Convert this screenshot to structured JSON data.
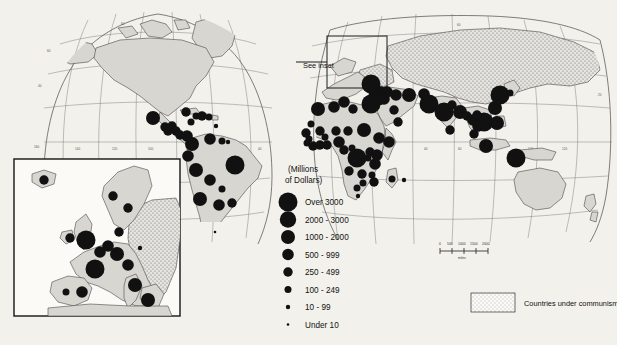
{
  "map": {
    "projection_note": "interrupted homolosine-style world map, two northern lobes",
    "inset_pointer_label": "See inset",
    "background_color": "#f3f1ec",
    "land_color": "#d8d6d1",
    "dot_color": "#111111",
    "communist_fill": "stipple"
  },
  "legend": {
    "units_line1": "(Millions",
    "units_line2": "of Dollars)",
    "classes": [
      {
        "label": "Over 3000",
        "radius_px": 9.5
      },
      {
        "label": "2000 - 3000",
        "radius_px": 8.2
      },
      {
        "label": "1000 - 2000",
        "radius_px": 7.0
      },
      {
        "label": "500 - 999",
        "radius_px": 5.8
      },
      {
        "label": "250 - 499",
        "radius_px": 4.7
      },
      {
        "label": "100 - 249",
        "radius_px": 3.5
      },
      {
        "label": "10 - 99",
        "radius_px": 2.2
      },
      {
        "label": "Under 10",
        "radius_px": 1.3
      }
    ]
  },
  "communism_legend": {
    "label": "Countries under communism",
    "swatch": "stipple"
  },
  "scale_bar": {
    "ticks": [
      "0",
      "500",
      "1000",
      "1500",
      "2000"
    ],
    "units": "miles"
  },
  "graticule_labels": {
    "top_lobe_left": [
      "60"
    ],
    "top_lobe_right": [
      "60"
    ],
    "left_lobe": [
      "60",
      "40"
    ],
    "equatorial": [
      "160",
      "140",
      "120",
      "100",
      "80",
      "60",
      "40",
      "20"
    ],
    "eastern": [
      "20",
      "40",
      "60",
      "80",
      "100",
      "120",
      "140",
      "160"
    ]
  },
  "chart_data": {
    "type": "map",
    "symbol": "graduated circle",
    "value_classes": [
      "Over 3000",
      "2000 - 3000",
      "1000 - 2000",
      "500 - 999",
      "250 - 499",
      "100 - 249",
      "10 - 99",
      "Under 10"
    ],
    "regions": [
      {
        "name": "Mexico",
        "class": "1000 - 2000",
        "x": 153,
        "y": 118
      },
      {
        "name": "Cuba",
        "class": "250 - 499",
        "x": 186,
        "y": 112
      },
      {
        "name": "Haiti",
        "class": "100 - 249",
        "x": 196,
        "y": 116
      },
      {
        "name": "Dom. Republic",
        "class": "250 - 499",
        "x": 202,
        "y": 116
      },
      {
        "name": "Guatemala",
        "class": "250 - 499",
        "x": 165,
        "y": 127
      },
      {
        "name": "Honduras",
        "class": "250 - 499",
        "x": 172,
        "y": 126
      },
      {
        "name": "El Salvador",
        "class": "250 - 499",
        "x": 168,
        "y": 131
      },
      {
        "name": "Nicaragua",
        "class": "250 - 499",
        "x": 176,
        "y": 131
      },
      {
        "name": "Costa Rica",
        "class": "250 - 499",
        "x": 180,
        "y": 135
      },
      {
        "name": "Panama",
        "class": "500 - 999",
        "x": 187,
        "y": 136
      },
      {
        "name": "Jamaica",
        "class": "100 - 249",
        "x": 191,
        "y": 122
      },
      {
        "name": "Puerto Rico",
        "class": "100 - 249",
        "x": 209,
        "y": 117
      },
      {
        "name": "Trinidad",
        "class": "10 - 99",
        "x": 216,
        "y": 126
      },
      {
        "name": "Colombia",
        "class": "1000 - 2000",
        "x": 192,
        "y": 144
      },
      {
        "name": "Venezuela",
        "class": "500 - 999",
        "x": 210,
        "y": 139
      },
      {
        "name": "Guyana",
        "class": "100 - 249",
        "x": 222,
        "y": 141
      },
      {
        "name": "Suriname",
        "class": "10 - 99",
        "x": 228,
        "y": 142
      },
      {
        "name": "Ecuador",
        "class": "500 - 999",
        "x": 188,
        "y": 156
      },
      {
        "name": "Peru",
        "class": "1000 - 2000",
        "x": 196,
        "y": 170
      },
      {
        "name": "Brazil",
        "class": "Over 3000",
        "x": 235,
        "y": 165
      },
      {
        "name": "Bolivia",
        "class": "500 - 999",
        "x": 210,
        "y": 180
      },
      {
        "name": "Paraguay",
        "class": "100 - 249",
        "x": 222,
        "y": 189
      },
      {
        "name": "Chile",
        "class": "1000 - 2000",
        "x": 200,
        "y": 199
      },
      {
        "name": "Argentina",
        "class": "500 - 999",
        "x": 219,
        "y": 205
      },
      {
        "name": "Uruguay",
        "class": "250 - 499",
        "x": 232,
        "y": 203
      },
      {
        "name": "Falklands",
        "class": "Under 10",
        "x": 215,
        "y": 232
      },
      {
        "name": "Morocco",
        "class": "1000 - 2000",
        "x": 318,
        "y": 109
      },
      {
        "name": "Algeria",
        "class": "500 - 999",
        "x": 334,
        "y": 107
      },
      {
        "name": "Tunisia",
        "class": "500 - 999",
        "x": 344,
        "y": 102
      },
      {
        "name": "Libya",
        "class": "250 - 499",
        "x": 353,
        "y": 109
      },
      {
        "name": "Egypt",
        "class": "Over 3000",
        "x": 371,
        "y": 104
      },
      {
        "name": "Israel",
        "class": "Over 3000",
        "x": 378,
        "y": 96
      },
      {
        "name": "Lebanon",
        "class": "250 - 499",
        "x": 381,
        "y": 91
      },
      {
        "name": "Syria",
        "class": "500 - 999",
        "x": 387,
        "y": 92
      },
      {
        "name": "Jordan",
        "class": "500 - 999",
        "x": 384,
        "y": 99
      },
      {
        "name": "Turkey",
        "class": "Over 3000",
        "x": 371,
        "y": 84
      },
      {
        "name": "Iraq",
        "class": "500 - 999",
        "x": 396,
        "y": 95
      },
      {
        "name": "Iran",
        "class": "1000 - 2000",
        "x": 409,
        "y": 95
      },
      {
        "name": "Saudi Arabia",
        "class": "250 - 499",
        "x": 394,
        "y": 110
      },
      {
        "name": "Yemen",
        "class": "250 - 499",
        "x": 398,
        "y": 122
      },
      {
        "name": "Afghanistan",
        "class": "500 - 999",
        "x": 424,
        "y": 94
      },
      {
        "name": "Pakistan",
        "class": "Over 3000",
        "x": 429,
        "y": 104
      },
      {
        "name": "India",
        "class": "Over 3000",
        "x": 444,
        "y": 112
      },
      {
        "name": "Nepal",
        "class": "250 - 499",
        "x": 452,
        "y": 105
      },
      {
        "name": "Sri Lanka",
        "class": "250 - 499",
        "x": 450,
        "y": 130
      },
      {
        "name": "Bangladesh",
        "class": "1000 - 2000",
        "x": 460,
        "y": 112
      },
      {
        "name": "Burma",
        "class": "250 - 499",
        "x": 467,
        "y": 116
      },
      {
        "name": "Thailand",
        "class": "500 - 999",
        "x": 473,
        "y": 120
      },
      {
        "name": "Vietnam",
        "class": "Over 3000",
        "x": 484,
        "y": 122
      },
      {
        "name": "Cambodia",
        "class": "500 - 999",
        "x": 478,
        "y": 126
      },
      {
        "name": "Laos",
        "class": "250 - 499",
        "x": 477,
        "y": 115
      },
      {
        "name": "Malaysia",
        "class": "250 - 499",
        "x": 474,
        "y": 134
      },
      {
        "name": "Indonesia",
        "class": "1000 - 2000",
        "x": 486,
        "y": 146
      },
      {
        "name": "Philippines",
        "class": "1000 - 2000",
        "x": 497,
        "y": 123
      },
      {
        "name": "Taiwan",
        "class": "1000 - 2000",
        "x": 495,
        "y": 108
      },
      {
        "name": "South Korea",
        "class": "Over 3000",
        "x": 500,
        "y": 95
      },
      {
        "name": "Japan",
        "class": "100 - 249",
        "x": 510,
        "y": 93
      },
      {
        "name": "Papua NG",
        "class": "Over 3000",
        "x": 516,
        "y": 158
      },
      {
        "name": "Mauritania",
        "class": "100 - 249",
        "x": 311,
        "y": 124
      },
      {
        "name": "Senegal",
        "class": "250 - 499",
        "x": 306,
        "y": 133
      },
      {
        "name": "Mali",
        "class": "250 - 499",
        "x": 320,
        "y": 131
      },
      {
        "name": "Guinea",
        "class": "100 - 249",
        "x": 309,
        "y": 139
      },
      {
        "name": "Sierra Leone",
        "class": "100 - 249",
        "x": 307,
        "y": 143
      },
      {
        "name": "Liberia",
        "class": "250 - 499",
        "x": 313,
        "y": 146
      },
      {
        "name": "Ivory Coast",
        "class": "250 - 499",
        "x": 320,
        "y": 145
      },
      {
        "name": "Ghana",
        "class": "250 - 499",
        "x": 327,
        "y": 145
      },
      {
        "name": "Burkina Faso",
        "class": "100 - 249",
        "x": 325,
        "y": 137
      },
      {
        "name": "Niger",
        "class": "250 - 499",
        "x": 336,
        "y": 131
      },
      {
        "name": "Nigeria",
        "class": "500 - 999",
        "x": 339,
        "y": 142
      },
      {
        "name": "Chad",
        "class": "250 - 499",
        "x": 348,
        "y": 131
      },
      {
        "name": "Sudan",
        "class": "1000 - 2000",
        "x": 364,
        "y": 130
      },
      {
        "name": "Ethiopia",
        "class": "500 - 999",
        "x": 379,
        "y": 138
      },
      {
        "name": "Somalia",
        "class": "500 - 999",
        "x": 389,
        "y": 142
      },
      {
        "name": "Cameroon",
        "class": "250 - 499",
        "x": 344,
        "y": 150
      },
      {
        "name": "CAR",
        "class": "100 - 249",
        "x": 352,
        "y": 148
      },
      {
        "name": "Zaire",
        "class": "Over 3000",
        "x": 357,
        "y": 158
      },
      {
        "name": "Uganda",
        "class": "250 - 499",
        "x": 370,
        "y": 152
      },
      {
        "name": "Kenya",
        "class": "500 - 999",
        "x": 377,
        "y": 155
      },
      {
        "name": "Tanzania",
        "class": "500 - 999",
        "x": 375,
        "y": 164
      },
      {
        "name": "Rwanda",
        "class": "100 - 249",
        "x": 368,
        "y": 158
      },
      {
        "name": "Angola",
        "class": "250 - 499",
        "x": 349,
        "y": 171
      },
      {
        "name": "Zambia",
        "class": "250 - 499",
        "x": 362,
        "y": 174
      },
      {
        "name": "Malawi",
        "class": "100 - 249",
        "x": 372,
        "y": 175
      },
      {
        "name": "Mozambique",
        "class": "250 - 499",
        "x": 374,
        "y": 182
      },
      {
        "name": "Zimbabwe",
        "class": "100 - 249",
        "x": 363,
        "y": 183
      },
      {
        "name": "Botswana",
        "class": "100 - 249",
        "x": 357,
        "y": 188
      },
      {
        "name": "Madagascar",
        "class": "100 - 249",
        "x": 392,
        "y": 179
      },
      {
        "name": "Mauritius",
        "class": "10 - 99",
        "x": 404,
        "y": 180
      },
      {
        "name": "South Africa",
        "class": "10 - 99",
        "x": 358,
        "y": 196
      }
    ],
    "inset": {
      "name": "Europe inset",
      "regions": [
        {
          "name": "Iceland",
          "class": "250 - 499",
          "x": 44,
          "y": 180
        },
        {
          "name": "Norway",
          "class": "250 - 499",
          "x": 113,
          "y": 196
        },
        {
          "name": "Sweden",
          "class": "250 - 499",
          "x": 128,
          "y": 208
        },
        {
          "name": "Denmark",
          "class": "250 - 499",
          "x": 119,
          "y": 232
        },
        {
          "name": "Ireland",
          "class": "250 - 499",
          "x": 70,
          "y": 238
        },
        {
          "name": "United Kingdom",
          "class": "Over 3000",
          "x": 86,
          "y": 240
        },
        {
          "name": "Netherlands",
          "class": "500 - 999",
          "x": 108,
          "y": 246
        },
        {
          "name": "Belgium",
          "class": "500 - 999",
          "x": 100,
          "y": 252
        },
        {
          "name": "West Germany",
          "class": "1000 - 2000",
          "x": 117,
          "y": 254
        },
        {
          "name": "Poland",
          "class": "10 - 99",
          "x": 140,
          "y": 248
        },
        {
          "name": "France",
          "class": "Over 3000",
          "x": 95,
          "y": 269
        },
        {
          "name": "Austria",
          "class": "500 - 999",
          "x": 128,
          "y": 265
        },
        {
          "name": "Spain",
          "class": "500 - 999",
          "x": 82,
          "y": 292
        },
        {
          "name": "Portugal",
          "class": "100 - 249",
          "x": 66,
          "y": 292
        },
        {
          "name": "Italy",
          "class": "1000 - 2000",
          "x": 135,
          "y": 285
        },
        {
          "name": "Greece",
          "class": "1000 - 2000",
          "x": 148,
          "y": 300
        }
      ]
    }
  }
}
